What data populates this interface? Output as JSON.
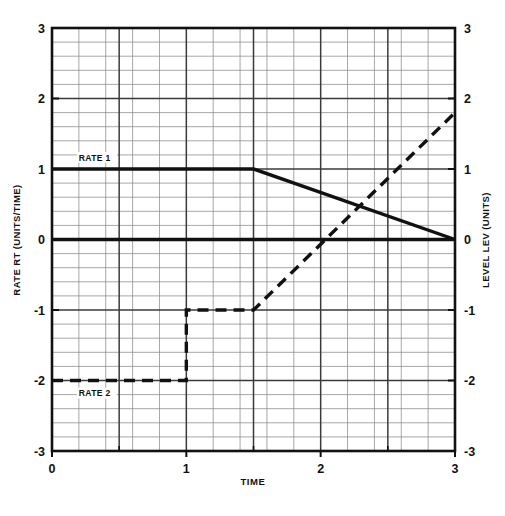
{
  "chart_data": {
    "type": "line",
    "title": "",
    "xlabel": "TIME",
    "ylabel_left": "RATE RT (UNITS/TIME)",
    "ylabel_right": "LEVEL LEV (UNITS)",
    "xlim": [
      0,
      3
    ],
    "ylim": [
      -3,
      3
    ],
    "xticks": [
      0,
      1,
      2,
      3
    ],
    "xticklabels": [
      "0",
      "1",
      "2",
      "3"
    ],
    "yticks": [
      -3,
      -2,
      -1,
      0,
      1,
      2,
      3
    ],
    "yticklabels_left": [
      "-3",
      "-2",
      "-1",
      "0",
      "1",
      "2",
      "3"
    ],
    "yticklabels_right": [
      "-3",
      "-2",
      "-1",
      "0",
      "1",
      "2",
      "3"
    ],
    "grid": true,
    "grid_minor_per_unit": 5,
    "legend_position": "inline-annotations",
    "series": [
      {
        "name": "RATE1",
        "style": "solid",
        "annotation": "RATE 1",
        "annotation_at": [
          0.2,
          1.12
        ],
        "points": [
          {
            "x": 0.0,
            "y": 1.0
          },
          {
            "x": 1.5,
            "y": 1.0
          },
          {
            "x": 3.0,
            "y": 0.0
          }
        ]
      },
      {
        "name": "LEVEL-ZERO",
        "style": "solid",
        "annotation": "",
        "points": [
          {
            "x": 0.0,
            "y": 0.0
          },
          {
            "x": 3.0,
            "y": 0.0
          }
        ]
      },
      {
        "name": "RATE2",
        "style": "dashed",
        "annotation": "RATE 2",
        "annotation_at": [
          0.2,
          -2.22
        ],
        "points": [
          {
            "x": 0.0,
            "y": -2.0
          },
          {
            "x": 1.0,
            "y": -2.0
          },
          {
            "x": 1.0,
            "y": -1.0
          },
          {
            "x": 1.5,
            "y": -1.0
          },
          {
            "x": 3.0,
            "y": 1.8
          }
        ]
      }
    ],
    "annotations": [
      {
        "text": "RATE 1",
        "x": 0.2,
        "y": 1.12
      },
      {
        "text": "RATE 2",
        "x": 0.2,
        "y": -2.22
      }
    ]
  },
  "style": {
    "ink": "#111111",
    "grid_minor": "#8a8a8a",
    "grid_major": "#3a3a3a",
    "frame": "#111111",
    "background": "#ffffff"
  }
}
